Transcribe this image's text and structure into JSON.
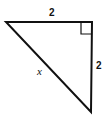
{
  "diagram": {
    "type": "right-triangle",
    "stroke_color": "#111111",
    "background_color": "#ffffff",
    "vertices": {
      "left": [
        6,
        22
      ],
      "top_right": [
        92,
        22
      ],
      "bottom": [
        91,
        112
      ]
    },
    "right_angle_at": "top_right",
    "labels": {
      "top_side": "2",
      "right_side": "2",
      "hypotenuse": "x"
    }
  }
}
